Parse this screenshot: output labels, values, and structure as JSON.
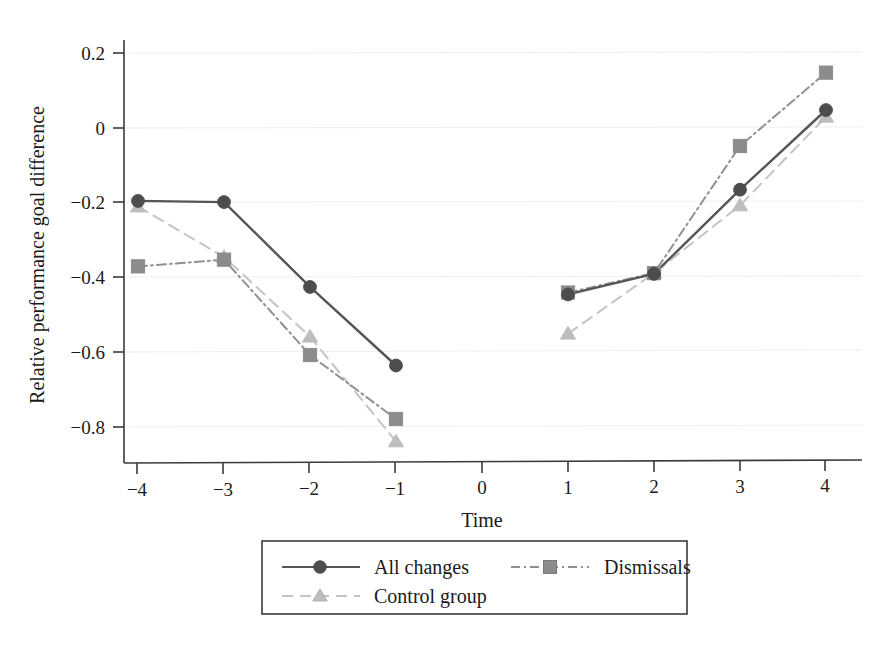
{
  "chart_data": {
    "type": "line",
    "title": "",
    "xlabel": "Time",
    "ylabel": "Relative performance goal difference",
    "xlim": [
      -4.35,
      4.35
    ],
    "ylim": [
      -0.9,
      0.26
    ],
    "x": [
      -4,
      -3,
      -2,
      -1,
      1,
      2,
      3,
      4
    ],
    "xtick_labels": [
      "−4",
      "−3",
      "−2",
      "−1",
      "0",
      "1",
      "2",
      "3",
      "4"
    ],
    "xtick_values": [
      -4,
      -3,
      -2,
      -1,
      0,
      1,
      2,
      3,
      4
    ],
    "ytick_labels": [
      "0.2",
      "0",
      "−0.2",
      "−0.4",
      "−0.6",
      "−0.8"
    ],
    "ytick_values": [
      0.2,
      0,
      -0.2,
      -0.4,
      -0.6,
      -0.8
    ],
    "grid": "horizontal-faint",
    "legend_position": "below-center",
    "gap_at_x": 0,
    "series": [
      {
        "name": "All changes",
        "marker": "circle",
        "line_style": "solid",
        "color": "#555555",
        "marker_color": "#4d4d4d",
        "values": [
          -0.195,
          -0.198,
          -0.425,
          -0.635,
          -0.445,
          -0.39,
          -0.165,
          0.048
        ]
      },
      {
        "name": "Dismissals",
        "marker": "square",
        "line_style": "dashdot",
        "color": "#909090",
        "marker_color": "#8c8c8c",
        "values": [
          -0.37,
          -0.352,
          -0.607,
          -0.778,
          -0.44,
          -0.388,
          -0.048,
          0.148
        ]
      },
      {
        "name": "Control group",
        "marker": "triangle",
        "line_style": "dashed",
        "color": "#c4c4c4",
        "marker_color": "#bdbdbd",
        "values": [
          -0.21,
          -0.345,
          -0.558,
          -0.838,
          -0.55,
          -0.388,
          -0.207,
          0.03
        ]
      }
    ]
  },
  "legend": {
    "entries": [
      {
        "label": "All changes"
      },
      {
        "label": "Dismissals"
      },
      {
        "label": "Control group"
      }
    ]
  },
  "axes": {
    "x_title": "Time",
    "y_title": "Relative performance goal difference"
  }
}
